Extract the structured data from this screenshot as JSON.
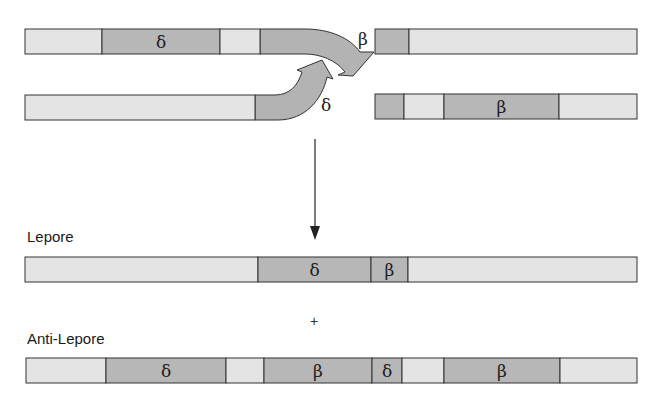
{
  "colors": {
    "light": "#e4e4e4",
    "dark": "#b7b7b7",
    "stroke": "#333333",
    "arrow_fill": "#b3b3b3"
  },
  "labels": {
    "delta": "δ",
    "beta": "β",
    "lepore": "Lepore",
    "anti_lepore": "Anti-Lepore",
    "plus": "+"
  },
  "chromosome_top_left": {
    "segments": [
      {
        "x0": 25,
        "x1": 102,
        "type": "light",
        "label": ""
      },
      {
        "x0": 102,
        "x1": 220,
        "type": "dark",
        "label": "δ"
      },
      {
        "x0": 220,
        "x1": 260,
        "type": "light",
        "label": ""
      }
    ],
    "arrow_label": "β"
  },
  "chromosome_top_right": {
    "segments": [
      {
        "x0": 375,
        "x1": 409,
        "type": "dark",
        "label": ""
      },
      {
        "x0": 409,
        "x1": 637,
        "type": "light",
        "label": ""
      }
    ]
  },
  "chromosome_bottom_left": {
    "segments": [
      {
        "x0": 25,
        "x1": 255,
        "type": "light",
        "label": ""
      }
    ],
    "arrow_label": "δ"
  },
  "chromosome_bottom_right": {
    "segments": [
      {
        "x0": 375,
        "x1": 404,
        "type": "dark",
        "label": ""
      },
      {
        "x0": 404,
        "x1": 444,
        "type": "light",
        "label": ""
      },
      {
        "x0": 444,
        "x1": 559,
        "type": "dark",
        "label": "β"
      },
      {
        "x0": 559,
        "x1": 637,
        "type": "light",
        "label": ""
      }
    ]
  },
  "lepore": {
    "title": "Lepore",
    "segments": [
      {
        "x0": 25,
        "x1": 258,
        "type": "light",
        "label": ""
      },
      {
        "x0": 258,
        "x1": 371,
        "type": "dark",
        "label": "δ"
      },
      {
        "x0": 371,
        "x1": 408,
        "type": "dark",
        "label": "β"
      },
      {
        "x0": 408,
        "x1": 637,
        "type": "light",
        "label": ""
      }
    ]
  },
  "anti_lepore": {
    "title": "Anti-Lepore",
    "segments": [
      {
        "x0": 26,
        "x1": 106,
        "type": "light",
        "label": ""
      },
      {
        "x0": 106,
        "x1": 226,
        "type": "dark",
        "label": "δ"
      },
      {
        "x0": 226,
        "x1": 264,
        "type": "light",
        "label": ""
      },
      {
        "x0": 264,
        "x1": 372,
        "type": "dark",
        "label": "β"
      },
      {
        "x0": 372,
        "x1": 402,
        "type": "dark",
        "label": "δ"
      },
      {
        "x0": 402,
        "x1": 444,
        "type": "light",
        "label": ""
      },
      {
        "x0": 444,
        "x1": 560,
        "type": "dark",
        "label": "β"
      },
      {
        "x0": 560,
        "x1": 637,
        "type": "light",
        "label": ""
      }
    ]
  }
}
